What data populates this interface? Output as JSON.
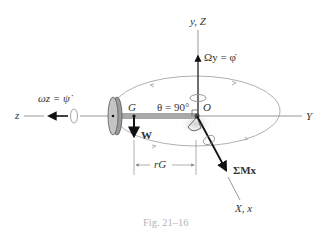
{
  "figure": {
    "caption": "Fig. 21–16",
    "labels": {
      "vertical_axis": "y, Z",
      "horizontal_right_axis": "Y",
      "horizontal_left_axis": "z",
      "diagonal_axis": "X, x",
      "precession_rate": "Ωy = φ̇",
      "spin_rate": "ωz = ψ̇",
      "center_of_mass": "G",
      "origin": "O",
      "angle": "θ = 90°",
      "weight": "W",
      "radius": "rG",
      "moment": "ΣMx"
    },
    "colors": {
      "ink": "#111111",
      "axis_gray": "#8c8c8c",
      "orbit_gray": "#b0b0b0",
      "rod_gray": "#a9a9a9",
      "disk_fill": "#bdbdbd",
      "caption": "#b4b4b4"
    }
  }
}
